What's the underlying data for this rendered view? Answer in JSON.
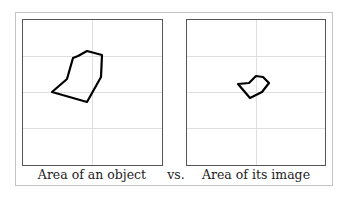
{
  "figure": {
    "left_panel": {
      "caption": "Area of an object",
      "polygon": [
        [
          52,
          92
        ],
        [
          67,
          79
        ],
        [
          73,
          58
        ],
        [
          78,
          56
        ],
        [
          87,
          51
        ],
        [
          102,
          55
        ],
        [
          101,
          77
        ],
        [
          87,
          102
        ]
      ]
    },
    "separator": "vs.",
    "right_panel": {
      "caption": "Area of its image",
      "polygon": [
        [
          238,
          84
        ],
        [
          249,
          83
        ],
        [
          256,
          76
        ],
        [
          263,
          77
        ],
        [
          269,
          83
        ],
        [
          262,
          92
        ],
        [
          250,
          98
        ]
      ]
    },
    "colors": {
      "frame": "#c4c4c4",
      "plot_border": "#555555",
      "grid": "#dedede",
      "shape": "#000000"
    }
  }
}
